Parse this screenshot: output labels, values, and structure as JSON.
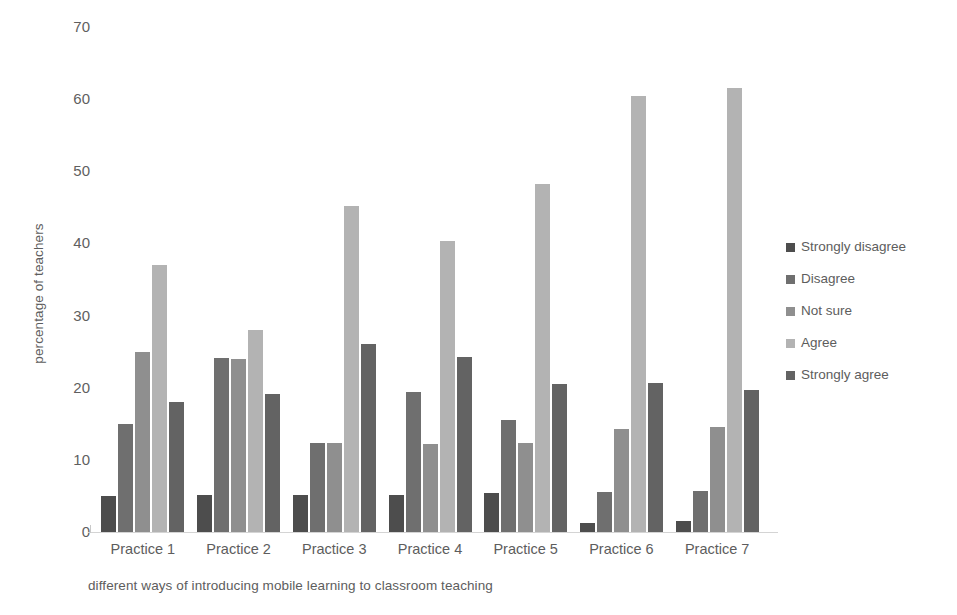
{
  "chart_data": {
    "type": "bar",
    "title": "",
    "xlabel": "different ways of introducing mobile learning to classroom teaching",
    "ylabel": "percentage of teachers",
    "ylim": [
      0,
      70
    ],
    "yticks": [
      0,
      10,
      20,
      30,
      40,
      50,
      60,
      70
    ],
    "grid": false,
    "legend_position": "right",
    "categories": [
      "Practice 1",
      "Practice 2",
      "Practice 3",
      "Practice 4",
      "Practice 5",
      "Practice 6",
      "Practice 7"
    ],
    "series": [
      {
        "name": "Strongly disagree",
        "color": "#4d4d4d",
        "values": [
          5.0,
          5.1,
          5.2,
          5.2,
          5.4,
          1.3,
          1.5
        ]
      },
      {
        "name": "Disagree",
        "color": "#6f6f6f",
        "values": [
          15.0,
          24.1,
          12.3,
          19.4,
          15.5,
          5.5,
          5.7
        ]
      },
      {
        "name": "Not sure",
        "color": "#8f8f8f",
        "values": [
          25.0,
          24.0,
          12.3,
          12.2,
          12.4,
          14.3,
          14.5
        ]
      },
      {
        "name": "Agree",
        "color": "#b3b3b3",
        "values": [
          37.0,
          28.0,
          45.2,
          40.3,
          48.3,
          60.5,
          61.5
        ]
      },
      {
        "name": "Strongly agree",
        "color": "#636363",
        "values": [
          18.0,
          19.2,
          26.1,
          24.3,
          20.5,
          20.6,
          19.7
        ]
      }
    ]
  }
}
